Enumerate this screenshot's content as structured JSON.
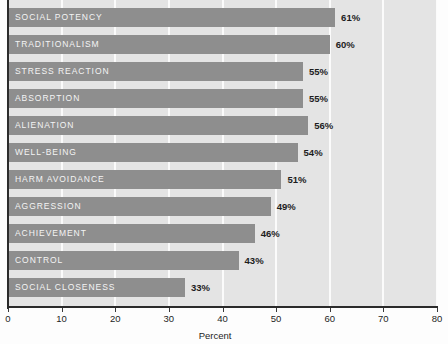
{
  "chart_data": {
    "type": "bar",
    "orientation": "horizontal",
    "title": "",
    "xlabel": "Percent",
    "ylabel": "",
    "xlim": [
      0,
      80
    ],
    "xticks": [
      0,
      10,
      20,
      30,
      40,
      50,
      60,
      70,
      80
    ],
    "xtick_labels": [
      "0",
      "10",
      "20",
      "30",
      "40",
      "50",
      "60",
      "70",
      "80"
    ],
    "grid": "vertical-white",
    "legend": "none",
    "categories": [
      "SOCIAL POTENCY",
      "TRADITIONALISM",
      "STRESS REACTION",
      "ABSORPTION",
      "ALIENATION",
      "WELL-BEING",
      "HARM AVOIDANCE",
      "AGGRESSION",
      "ACHIEVEMENT",
      "CONTROL",
      "SOCIAL CLOSENESS"
    ],
    "values": [
      61,
      60,
      55,
      55,
      56,
      54,
      51,
      49,
      46,
      43,
      33
    ],
    "value_labels": [
      "61%",
      "60%",
      "55%",
      "55%",
      "56%",
      "54%",
      "51%",
      "49%",
      "46%",
      "43%",
      "33%"
    ],
    "colors": {
      "bar_fill": "#8e8e8e",
      "plot_background": "#e4e4e4",
      "gridline": "#fbfbfb",
      "axis": "#2b2b2b",
      "bar_label_text": "#f4f4f4",
      "value_label_text": "#1d1d1d",
      "figure_background": "#fdfdfd"
    }
  }
}
